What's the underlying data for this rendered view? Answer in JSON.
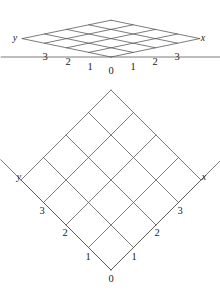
{
  "figure": {
    "line_color": "#53504e",
    "text_color": "#1c1c1c",
    "background_color": "#ffffff",
    "panels": [
      {
        "name": "perspective-lattice",
        "description": "Foreshortened perspective view of a square lattice with axes x and y",
        "axis_labels": [
          {
            "text": "y",
            "x": 15,
            "y": 38
          },
          {
            "text": "x",
            "x": 203,
            "y": 38
          }
        ],
        "tick_labels": [
          {
            "text": "3",
            "x": 45,
            "y": 57
          },
          {
            "text": "2",
            "x": 68,
            "y": 62
          },
          {
            "text": "1",
            "x": 90,
            "y": 67
          },
          {
            "text": "0",
            "x": 111,
            "y": 71
          },
          {
            "text": "1",
            "x": 133,
            "y": 67
          },
          {
            "text": "2",
            "x": 155,
            "y": 62
          },
          {
            "text": "3",
            "x": 177,
            "y": 57
          }
        ],
        "geometry": {
          "origin_x": 111,
          "origin_y": 57,
          "step_x": 22.2,
          "step_y": 4.6,
          "rows": 4,
          "cols": 4
        }
      },
      {
        "name": "plan-lattice",
        "description": "Plan view of the same square lattice rotated 45 degrees, forming a diamond grid",
        "axis_labels": [
          {
            "text": "y",
            "x": 19,
            "y": 177
          },
          {
            "text": "x",
            "x": 204,
            "y": 177
          }
        ],
        "tick_labels": [
          {
            "text": "3",
            "x": 42,
            "y": 211
          },
          {
            "text": "2",
            "x": 65,
            "y": 233
          },
          {
            "text": "1",
            "x": 88,
            "y": 257
          },
          {
            "text": "0",
            "x": 111,
            "y": 279
          },
          {
            "text": "1",
            "x": 134,
            "y": 257
          },
          {
            "text": "2",
            "x": 157,
            "y": 233
          },
          {
            "text": "3",
            "x": 180,
            "y": 211
          }
        ],
        "geometry": {
          "origin_x": 111,
          "origin_y": 270,
          "step": 22.5,
          "rows": 4,
          "cols": 4
        }
      }
    ]
  }
}
